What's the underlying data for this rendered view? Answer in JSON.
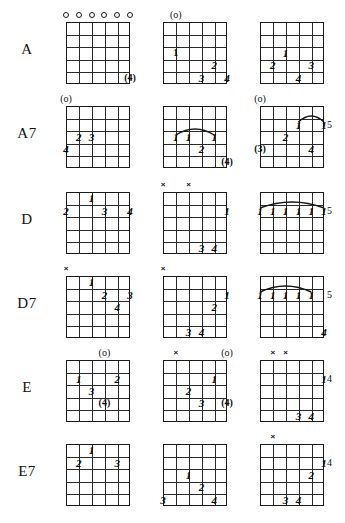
{
  "page": {
    "rows_count": 6,
    "columns_per_row": 3,
    "strings": 6,
    "frets": 5
  },
  "glyphs": {
    "open": "o",
    "open_paren": "(o)",
    "mute": "×",
    "finger_1": "1",
    "finger_2": "2",
    "finger_3": "3",
    "finger_4": "4",
    "finger_1_circled": "①",
    "finger_3_circled": "(3)",
    "finger_4_circled": "(4)"
  },
  "rows": [
    {
      "label": "A",
      "diagrams": [
        {
          "name": "a-open",
          "fret_marker": "",
          "top_markers": [
            {
              "string": 1,
              "type": "open",
              "text": "o"
            },
            {
              "string": 2,
              "type": "open",
              "text": "o"
            },
            {
              "string": 3,
              "type": "open",
              "text": "o"
            },
            {
              "string": 4,
              "type": "open",
              "text": "o"
            },
            {
              "string": 5,
              "type": "open",
              "text": "o"
            },
            {
              "string": 6,
              "type": "open",
              "text": "o"
            }
          ],
          "fingers": [
            {
              "text": "(4)",
              "string": 6,
              "fret": 5,
              "circled": true
            }
          ],
          "barres": []
        },
        {
          "name": "a-second",
          "fret_marker": "",
          "top_markers": [
            {
              "string": 2,
              "type": "open_paren",
              "text": "(o)"
            }
          ],
          "fingers": [
            {
              "text": "1",
              "string": 2,
              "fret": 3,
              "circled": true
            },
            {
              "text": "2",
              "string": 5,
              "fret": 4,
              "circled": false
            },
            {
              "text": "3",
              "string": 4,
              "fret": 5,
              "circled": false
            },
            {
              "text": "4",
              "string": 6,
              "fret": 5,
              "circled": false
            }
          ],
          "barres": []
        },
        {
          "name": "a-third",
          "fret_marker": "",
          "top_markers": [],
          "fingers": [
            {
              "text": "1",
              "string": 3,
              "fret": 3,
              "circled": false
            },
            {
              "text": "2",
              "string": 2,
              "fret": 4,
              "circled": false
            },
            {
              "text": "3",
              "string": 5,
              "fret": 4,
              "circled": false
            },
            {
              "text": "4",
              "string": 4,
              "fret": 5,
              "circled": false
            }
          ],
          "barres": []
        }
      ]
    },
    {
      "label": "A7",
      "diagrams": [
        {
          "name": "a7-open",
          "fret_marker": "",
          "top_markers": [
            {
              "string": 1,
              "type": "open_paren",
              "text": "(o)"
            }
          ],
          "fingers": [
            {
              "text": "2",
              "string": 2,
              "fret": 3,
              "circled": false
            },
            {
              "text": "3",
              "string": 3,
              "fret": 3,
              "circled": false
            },
            {
              "text": "4",
              "string": 1,
              "fret": 4,
              "circled": false
            }
          ],
          "barres": []
        },
        {
          "name": "a7-second",
          "fret_marker": "",
          "top_markers": [],
          "fingers": [
            {
              "text": "1",
              "string": 2,
              "fret": 3,
              "circled": false
            },
            {
              "text": "1",
              "string": 3,
              "fret": 3,
              "circled": false
            },
            {
              "text": "1",
              "string": 5,
              "fret": 3,
              "circled": false
            },
            {
              "text": "2",
              "string": 4,
              "fret": 4,
              "circled": false
            },
            {
              "text": "(4)",
              "string": 6,
              "fret": 5,
              "circled": true
            }
          ],
          "barres": [
            {
              "from_string": 2,
              "to_string": 5,
              "fret": 3
            }
          ]
        },
        {
          "name": "a7-third",
          "fret_marker": "5",
          "top_markers": [
            {
              "string": 1,
              "type": "open_paren",
              "text": "(o)"
            }
          ],
          "fingers": [
            {
              "text": "1",
              "string": 4,
              "fret": 2,
              "circled": false
            },
            {
              "text": "1",
              "string": 6,
              "fret": 2,
              "circled": false
            },
            {
              "text": "2",
              "string": 3,
              "fret": 3,
              "circled": false
            },
            {
              "text": "(3)",
              "string": 1,
              "fret": 4,
              "circled": true
            },
            {
              "text": "4",
              "string": 5,
              "fret": 4,
              "circled": false
            }
          ],
          "barres": [
            {
              "from_string": 4,
              "to_string": 6,
              "fret": 2
            }
          ]
        }
      ]
    },
    {
      "label": "D",
      "diagrams": [
        {
          "name": "d-open",
          "fret_marker": "",
          "top_markers": [],
          "fingers": [
            {
              "text": "1",
              "string": 3,
              "fret": 1,
              "circled": false
            },
            {
              "text": "2",
              "string": 1,
              "fret": 2,
              "circled": false
            },
            {
              "text": "3",
              "string": 4,
              "fret": 2,
              "circled": false
            },
            {
              "text": "4",
              "string": 6,
              "fret": 2,
              "circled": false
            }
          ],
          "barres": []
        },
        {
          "name": "d-second",
          "fret_marker": "",
          "top_markers": [
            {
              "string": 1,
              "type": "mute",
              "text": "×"
            },
            {
              "string": 3,
              "type": "mute",
              "text": "×"
            }
          ],
          "fingers": [
            {
              "text": "1",
              "string": 6,
              "fret": 2,
              "circled": false
            },
            {
              "text": "3",
              "string": 4,
              "fret": 5,
              "circled": false
            },
            {
              "text": "4",
              "string": 5,
              "fret": 5,
              "circled": false
            }
          ],
          "barres": []
        },
        {
          "name": "d-third",
          "fret_marker": "5",
          "top_markers": [],
          "fingers": [
            {
              "text": "1",
              "string": 1,
              "fret": 2,
              "circled": false
            },
            {
              "text": "1",
              "string": 2,
              "fret": 2,
              "circled": false
            },
            {
              "text": "1",
              "string": 3,
              "fret": 2,
              "circled": false
            },
            {
              "text": "1",
              "string": 4,
              "fret": 2,
              "circled": false
            },
            {
              "text": "1",
              "string": 5,
              "fret": 2,
              "circled": false
            },
            {
              "text": "1",
              "string": 6,
              "fret": 2,
              "circled": false
            }
          ],
          "barres": [
            {
              "from_string": 1,
              "to_string": 6,
              "fret": 2
            }
          ]
        }
      ]
    },
    {
      "label": "D7",
      "diagrams": [
        {
          "name": "d7-open",
          "fret_marker": "",
          "top_markers": [
            {
              "string": 1,
              "type": "mute",
              "text": "×"
            }
          ],
          "fingers": [
            {
              "text": "1",
              "string": 3,
              "fret": 1,
              "circled": false
            },
            {
              "text": "2",
              "string": 4,
              "fret": 2,
              "circled": false
            },
            {
              "text": "3",
              "string": 6,
              "fret": 2,
              "circled": false
            },
            {
              "text": "4",
              "string": 5,
              "fret": 3,
              "circled": false
            }
          ],
          "barres": []
        },
        {
          "name": "d7-second",
          "fret_marker": "",
          "top_markers": [
            {
              "string": 1,
              "type": "mute",
              "text": "×"
            }
          ],
          "fingers": [
            {
              "text": "1",
              "string": 6,
              "fret": 2,
              "circled": false
            },
            {
              "text": "2",
              "string": 5,
              "fret": 3,
              "circled": false
            },
            {
              "text": "3",
              "string": 3,
              "fret": 5,
              "circled": false
            },
            {
              "text": "4",
              "string": 4,
              "fret": 5,
              "circled": false
            }
          ],
          "barres": []
        },
        {
          "name": "d7-third",
          "fret_marker": "5",
          "top_markers": [],
          "fingers": [
            {
              "text": "1",
              "string": 1,
              "fret": 2,
              "circled": false
            },
            {
              "text": "1",
              "string": 2,
              "fret": 2,
              "circled": false
            },
            {
              "text": "1",
              "string": 3,
              "fret": 2,
              "circled": false
            },
            {
              "text": "1",
              "string": 4,
              "fret": 2,
              "circled": false
            },
            {
              "text": "1",
              "string": 5,
              "fret": 2,
              "circled": false
            },
            {
              "text": "4",
              "string": 6,
              "fret": 5,
              "circled": false
            }
          ],
          "barres": [
            {
              "from_string": 1,
              "to_string": 5,
              "fret": 2
            }
          ]
        }
      ]
    },
    {
      "label": "E",
      "diagrams": [
        {
          "name": "e-open",
          "fret_marker": "",
          "top_markers": [
            {
              "string": 4,
              "type": "open_paren",
              "text": "(o)"
            }
          ],
          "fingers": [
            {
              "text": "1",
              "string": 2,
              "fret": 2,
              "circled": false
            },
            {
              "text": "2",
              "string": 5,
              "fret": 2,
              "circled": false
            },
            {
              "text": "3",
              "string": 3,
              "fret": 3,
              "circled": false
            },
            {
              "text": "(4)",
              "string": 4,
              "fret": 4,
              "circled": true
            }
          ],
          "barres": []
        },
        {
          "name": "e-second",
          "fret_marker": "",
          "top_markers": [
            {
              "string": 2,
              "type": "mute",
              "text": "×"
            },
            {
              "string": 6,
              "type": "open_paren",
              "text": "(o)"
            }
          ],
          "fingers": [
            {
              "text": "1",
              "string": 5,
              "fret": 2,
              "circled": false
            },
            {
              "text": "2",
              "string": 3,
              "fret": 3,
              "circled": false
            },
            {
              "text": "3",
              "string": 4,
              "fret": 4,
              "circled": false
            },
            {
              "text": "(4)",
              "string": 6,
              "fret": 4,
              "circled": true
            }
          ],
          "barres": []
        },
        {
          "name": "e-third",
          "fret_marker": "4",
          "top_markers": [
            {
              "string": 2,
              "type": "mute",
              "text": "×"
            },
            {
              "string": 3,
              "type": "mute",
              "text": "×"
            }
          ],
          "fingers": [
            {
              "text": "1",
              "string": 6,
              "fret": 2,
              "circled": false
            },
            {
              "text": "3",
              "string": 4,
              "fret": 5,
              "circled": false
            },
            {
              "text": "4",
              "string": 5,
              "fret": 5,
              "circled": false
            }
          ],
          "barres": []
        }
      ]
    },
    {
      "label": "E7",
      "diagrams": [
        {
          "name": "e7-open",
          "fret_marker": "",
          "top_markers": [],
          "fingers": [
            {
              "text": "1",
              "string": 3,
              "fret": 1,
              "circled": false
            },
            {
              "text": "2",
              "string": 2,
              "fret": 2,
              "circled": false
            },
            {
              "text": "3",
              "string": 5,
              "fret": 2,
              "circled": false
            }
          ],
          "barres": []
        },
        {
          "name": "e7-second",
          "fret_marker": "",
          "top_markers": [],
          "fingers": [
            {
              "text": "1",
              "string": 3,
              "fret": 3,
              "circled": false
            },
            {
              "text": "2",
              "string": 4,
              "fret": 4,
              "circled": false
            },
            {
              "text": "3",
              "string": 1,
              "fret": 5,
              "circled": false
            },
            {
              "text": "4",
              "string": 5,
              "fret": 5,
              "circled": false
            }
          ],
          "barres": []
        },
        {
          "name": "e7-third",
          "fret_marker": "4",
          "top_markers": [
            {
              "string": 2,
              "type": "mute",
              "text": "×"
            }
          ],
          "fingers": [
            {
              "text": "1",
              "string": 6,
              "fret": 2,
              "circled": false
            },
            {
              "text": "2",
              "string": 5,
              "fret": 3,
              "circled": false
            },
            {
              "text": "3",
              "string": 3,
              "fret": 5,
              "circled": false
            },
            {
              "text": "4",
              "string": 4,
              "fret": 5,
              "circled": false
            }
          ],
          "barres": []
        }
      ]
    }
  ]
}
